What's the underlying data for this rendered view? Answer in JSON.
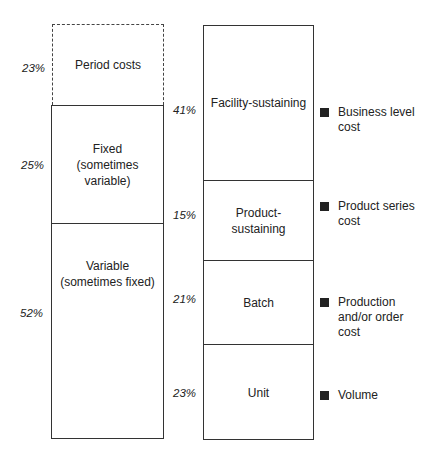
{
  "left_column": {
    "period": {
      "label": "Period costs",
      "pct": "23%"
    },
    "fixed": {
      "label_1": "Fixed",
      "label_2": "(sometimes",
      "label_3": "variable)",
      "pct": "25%"
    },
    "variable": {
      "label_1": "Variable",
      "label_2": "(sometimes fixed)",
      "pct": "52%"
    }
  },
  "right_column": {
    "facility": {
      "label": "Facility-sustaining",
      "pct": "41%",
      "legend_1": "Business level",
      "legend_2": "cost"
    },
    "product": {
      "label_1": "Product-",
      "label_2": "sustaining",
      "pct": "15%",
      "legend_1": "Product series",
      "legend_2": "cost"
    },
    "batch": {
      "label": "Batch",
      "pct": "21%",
      "legend_1": "Production",
      "legend_2": "and/or order",
      "legend_3": "cost"
    },
    "unit": {
      "label": "Unit",
      "pct": "23%",
      "legend_1": "Volume"
    }
  }
}
